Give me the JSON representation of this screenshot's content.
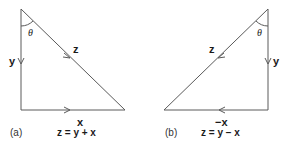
{
  "figure": {
    "panels": [
      {
        "id": "a",
        "panel_label": "(a)",
        "angle_label": "θ",
        "vectors": {
          "z": "z",
          "y": "y",
          "x": "x"
        },
        "equation": "z = y + x"
      },
      {
        "id": "b",
        "panel_label": "(b)",
        "angle_label": "θ",
        "vectors": {
          "z": "z",
          "y": "y",
          "x": "−x"
        },
        "equation": "z = y − x"
      }
    ],
    "colors": {
      "line": "#555555",
      "text": "#1a1a1a"
    }
  }
}
